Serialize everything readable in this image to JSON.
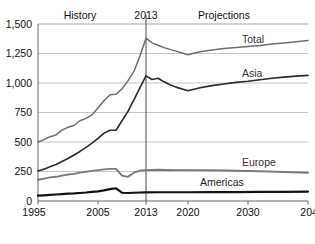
{
  "chart_data": {
    "type": "line",
    "title": "",
    "xlabel": "",
    "ylabel": "",
    "xlim": [
      1995,
      2040
    ],
    "ylim": [
      0,
      1500
    ],
    "grid": true,
    "legend_position": "inline-right-of-series",
    "y_ticks": [
      "0",
      "250",
      "500",
      "750",
      "1,000",
      "1,250",
      "1,500"
    ],
    "y_tick_values": [
      0,
      250,
      500,
      750,
      1000,
      1250,
      1500
    ],
    "x_ticks": [
      "1995",
      "2005",
      "2013",
      "2020",
      "2030",
      "2040"
    ],
    "x_tick_values": [
      1995,
      2005,
      2013,
      2020,
      2030,
      2040
    ],
    "annotations": [
      {
        "text": "History",
        "x": 2002,
        "position": "top"
      },
      {
        "text": "2013",
        "x": 2013,
        "position": "top"
      },
      {
        "text": "Projections",
        "x": 2026,
        "position": "top"
      }
    ],
    "divider_year": 2013,
    "series": [
      {
        "name": "Total",
        "color": "#6e6e6e",
        "label": "Total",
        "label_x": 2029,
        "label_y": 1340,
        "x": [
          1995,
          1996,
          1997,
          1998,
          1999,
          2000,
          2001,
          2002,
          2003,
          2004,
          2005,
          2006,
          2007,
          2008,
          2009,
          2010,
          2011,
          2012,
          2013,
          2014,
          2015,
          2016,
          2017,
          2018,
          2020,
          2022,
          2024,
          2026,
          2028,
          2030,
          2032,
          2034,
          2036,
          2038,
          2040
        ],
        "values": [
          500,
          520,
          545,
          560,
          600,
          625,
          640,
          680,
          700,
          730,
          790,
          850,
          900,
          905,
          950,
          1020,
          1100,
          1230,
          1380,
          1340,
          1320,
          1300,
          1285,
          1270,
          1240,
          1265,
          1280,
          1292,
          1300,
          1310,
          1318,
          1330,
          1340,
          1350,
          1360
        ]
      },
      {
        "name": "Asia",
        "color": "#2b2b2b",
        "label": "Asia",
        "label_x": 2029,
        "label_y": 1048,
        "x": [
          1995,
          1996,
          1997,
          1998,
          1999,
          2000,
          2001,
          2002,
          2003,
          2004,
          2005,
          2006,
          2007,
          2008,
          2009,
          2010,
          2011,
          2012,
          2013,
          2014,
          2015,
          2016,
          2017,
          2018,
          2020,
          2022,
          2024,
          2026,
          2028,
          2030,
          2032,
          2034,
          2036,
          2038,
          2040
        ],
        "values": [
          255,
          270,
          290,
          310,
          335,
          360,
          390,
          420,
          455,
          490,
          530,
          575,
          600,
          600,
          680,
          760,
          860,
          960,
          1060,
          1030,
          1040,
          1010,
          985,
          965,
          935,
          960,
          978,
          992,
          1005,
          1015,
          1028,
          1040,
          1050,
          1058,
          1065
        ]
      },
      {
        "name": "Europe",
        "color": "#7a7a7a",
        "label": "Europe",
        "label_x": 2029,
        "label_y": 300,
        "x": [
          1995,
          1996,
          1997,
          1998,
          1999,
          2000,
          2001,
          2002,
          2003,
          2004,
          2005,
          2006,
          2007,
          2008,
          2009,
          2010,
          2011,
          2012,
          2013,
          2015,
          2018,
          2020,
          2024,
          2028,
          2032,
          2036,
          2040
        ],
        "values": [
          180,
          190,
          200,
          205,
          215,
          225,
          230,
          240,
          248,
          255,
          262,
          268,
          272,
          272,
          215,
          205,
          240,
          258,
          262,
          265,
          262,
          262,
          260,
          256,
          252,
          246,
          240
        ]
      },
      {
        "name": "Americas",
        "color": "#111111",
        "label": "Americas",
        "label_x": 2022,
        "label_y": 128,
        "x": [
          1995,
          1996,
          1997,
          1998,
          1999,
          2000,
          2001,
          2002,
          2003,
          2004,
          2005,
          2006,
          2007,
          2008,
          2009,
          2010,
          2011,
          2012,
          2013,
          2015,
          2018,
          2020,
          2024,
          2028,
          2032,
          2036,
          2040
        ],
        "values": [
          45,
          48,
          52,
          55,
          58,
          62,
          64,
          68,
          72,
          78,
          82,
          90,
          100,
          108,
          70,
          68,
          70,
          72,
          73,
          74,
          74,
          74,
          75,
          76,
          77,
          78,
          80
        ]
      }
    ]
  }
}
